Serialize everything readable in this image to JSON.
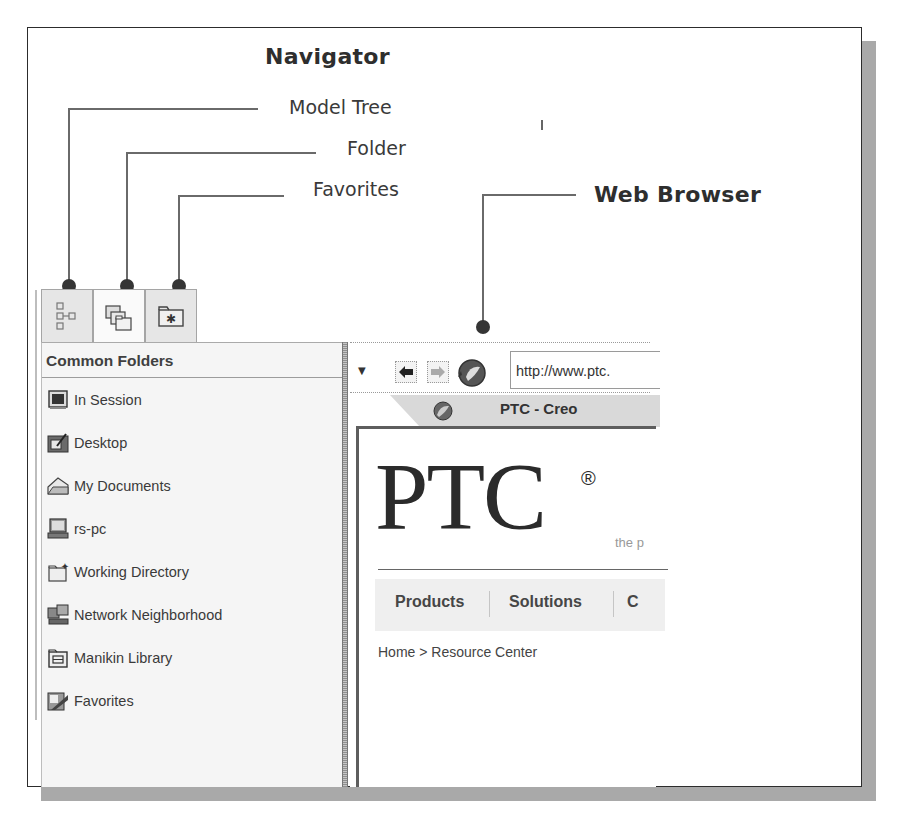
{
  "callouts": {
    "navigator": "Navigator",
    "model_tree": "Model Tree",
    "folder": "Folder",
    "favorites": "Favorites",
    "web_browser": "Web Browser"
  },
  "navigator": {
    "tabs": [
      {
        "name": "model-tree",
        "icon": "model-tree-icon",
        "active": false
      },
      {
        "name": "folder",
        "icon": "folder-browser-icon",
        "active": true
      },
      {
        "name": "favorites",
        "icon": "favorites-folder-icon",
        "active": false
      }
    ],
    "header": "Common Folders",
    "items": [
      {
        "label": "In Session",
        "icon": "in-session-icon"
      },
      {
        "label": "Desktop",
        "icon": "desktop-icon"
      },
      {
        "label": "My Documents",
        "icon": "my-documents-icon"
      },
      {
        "label": "rs-pc",
        "icon": "computer-icon"
      },
      {
        "label": "Working Directory",
        "icon": "working-directory-icon"
      },
      {
        "label": "Network Neighborhood",
        "icon": "network-icon"
      },
      {
        "label": "Manikin Library",
        "icon": "manikin-library-icon"
      },
      {
        "label": "Favorites",
        "icon": "favorites-icon"
      }
    ]
  },
  "browser": {
    "url": "http://www.ptc.",
    "tab_title": "PTC - Creo",
    "logo": "PTC",
    "registered_mark": "®",
    "tagline": "the p",
    "menu": [
      "Products",
      "Solutions",
      "C"
    ],
    "breadcrumb": "Home > Resource Center"
  },
  "colors": {
    "frame_border": "#2c2c2c",
    "shadow": "#a9a9a9",
    "panel_bg": "#f5f5f5",
    "callout_line": "#6a6a6a"
  }
}
